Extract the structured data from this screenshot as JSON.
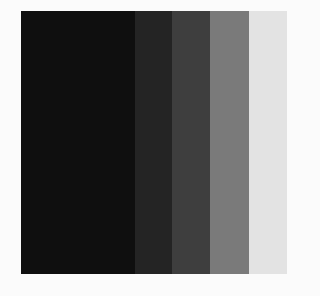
{
  "background": "#fbfbfb",
  "swatches": [
    {
      "name": "black",
      "color": "#0f0f0f",
      "width": 114
    },
    {
      "name": "very-dark-gray",
      "color": "#242424",
      "width": 37
    },
    {
      "name": "dark-gray",
      "color": "#3e3e3e",
      "width": 38
    },
    {
      "name": "mid-gray",
      "color": "#7a7a7a",
      "width": 39
    },
    {
      "name": "light-gray",
      "color": "#e3e3e3",
      "width": 38
    }
  ]
}
